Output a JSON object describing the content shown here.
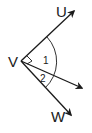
{
  "diagram": {
    "type": "angle-diagram",
    "vertex": {
      "label": "V",
      "x": 21,
      "y": 61
    },
    "rays": [
      {
        "name": "ray-VU",
        "label": "U",
        "tip": {
          "x": 75,
          "y": 10
        },
        "label_pos": {
          "x": 57,
          "y": 16
        }
      },
      {
        "name": "ray-middle",
        "label": "",
        "tip": {
          "x": 83,
          "y": 89
        }
      },
      {
        "name": "ray-VW",
        "label": "W",
        "tip": {
          "x": 72,
          "y": 116
        },
        "label_pos": {
          "x": 52,
          "y": 121
        }
      }
    ],
    "angles": [
      {
        "label": "1",
        "pos": {
          "x": 44,
          "y": 63
        }
      },
      {
        "label": "2",
        "pos": {
          "x": 40,
          "y": 82
        }
      }
    ],
    "colors": {
      "stroke": "#1a1a1a",
      "background": "#ffffff"
    }
  }
}
